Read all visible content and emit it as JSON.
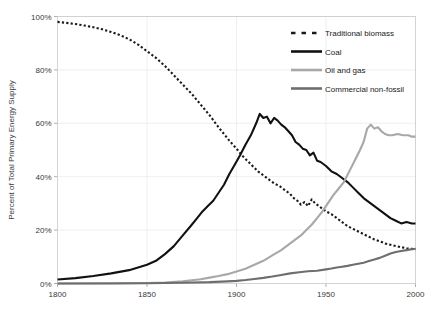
{
  "chart_data": {
    "type": "line",
    "title": "",
    "xlabel": "",
    "ylabel": "Percent of Total Primary Energy Supply",
    "xlim": [
      1800,
      2000
    ],
    "ylim": [
      0,
      100
    ],
    "xticks": [
      1800,
      1850,
      1900,
      1950,
      2000
    ],
    "xtick_labels": [
      "1800",
      "1850",
      "1900",
      "1950",
      "2000"
    ],
    "yticks": [
      0,
      20,
      40,
      60,
      80,
      100
    ],
    "ytick_labels": [
      "0%",
      "20%",
      "40%",
      "60%",
      "80%",
      "100%"
    ],
    "grid": true,
    "legend_position": "top-right",
    "series": [
      {
        "name": "Traditional biomass",
        "color": "#1a1a1a",
        "style": "dashed",
        "width": 2.1,
        "x": [
          1800,
          1805,
          1810,
          1815,
          1820,
          1825,
          1830,
          1835,
          1840,
          1845,
          1850,
          1855,
          1860,
          1865,
          1870,
          1875,
          1880,
          1885,
          1890,
          1893,
          1896,
          1900,
          1903,
          1906,
          1909,
          1912,
          1915,
          1918,
          1921,
          1924,
          1927,
          1930,
          1932,
          1934,
          1936,
          1938,
          1940,
          1942,
          1944,
          1946,
          1948,
          1950,
          1953,
          1956,
          1959,
          1962,
          1965,
          1968,
          1971,
          1974,
          1977,
          1980,
          1983,
          1986,
          1989,
          1992,
          1995,
          1998,
          2000
        ],
        "y": [
          98,
          97.6,
          97.2,
          96.6,
          96,
          95.2,
          94.2,
          93,
          91.5,
          89.5,
          87,
          84.5,
          81.5,
          78,
          74.5,
          71,
          67,
          63,
          58.5,
          56,
          53.5,
          50.5,
          48,
          46,
          44,
          42,
          40.5,
          39,
          37.5,
          36.5,
          35,
          33.5,
          32,
          31,
          29.5,
          30.5,
          29,
          31.5,
          30,
          29,
          28,
          27,
          26,
          24.5,
          23,
          21.5,
          20.5,
          19.5,
          18.5,
          17.5,
          16.5,
          15.8,
          15,
          14.5,
          14,
          13.6,
          13.2,
          13,
          12.8
        ]
      },
      {
        "name": "Coal",
        "color": "#111111",
        "style": "solid",
        "width": 2.1,
        "x": [
          1800,
          1810,
          1820,
          1830,
          1840,
          1850,
          1855,
          1860,
          1865,
          1870,
          1875,
          1878,
          1881,
          1884,
          1887,
          1890,
          1893,
          1896,
          1899,
          1902,
          1905,
          1908,
          1911,
          1913,
          1915,
          1917,
          1919,
          1921,
          1923,
          1925,
          1927,
          1929,
          1931,
          1933,
          1935,
          1937,
          1939,
          1941,
          1943,
          1945,
          1947,
          1950,
          1953,
          1956,
          1959,
          1962,
          1965,
          1968,
          1971,
          1974,
          1977,
          1980,
          1983,
          1986,
          1989,
          1992,
          1995,
          1998,
          2000
        ],
        "y": [
          1.5,
          2,
          2.8,
          3.8,
          5,
          7,
          8.5,
          11,
          14,
          18,
          22,
          24.5,
          27,
          29,
          31,
          34,
          37,
          41,
          44.5,
          48,
          52,
          55.5,
          60,
          63.5,
          62,
          62.5,
          60,
          62,
          61,
          59.5,
          58.5,
          57,
          55.5,
          53,
          52,
          50.5,
          50,
          48,
          49,
          46,
          45.5,
          44,
          42,
          41,
          39.5,
          38,
          36,
          34,
          32,
          30.5,
          29,
          27.5,
          26,
          24.5,
          23.5,
          22.5,
          23,
          22.5,
          22.5
        ]
      },
      {
        "name": "Oil and gas",
        "color": "#a8a8a8",
        "style": "solid",
        "width": 2.1,
        "x": [
          1800,
          1830,
          1850,
          1860,
          1870,
          1875,
          1880,
          1885,
          1890,
          1895,
          1900,
          1905,
          1910,
          1915,
          1920,
          1925,
          1930,
          1933,
          1936,
          1939,
          1942,
          1945,
          1948,
          1951,
          1954,
          1957,
          1960,
          1963,
          1966,
          1969,
          1971,
          1973,
          1975,
          1977,
          1979,
          1981,
          1983,
          1985,
          1987,
          1990,
          1993,
          1996,
          1998,
          2000
        ],
        "y": [
          0,
          0,
          0.2,
          0.4,
          0.8,
          1.2,
          1.6,
          2.2,
          2.8,
          3.5,
          4.5,
          5.5,
          7,
          8.5,
          10.5,
          12.5,
          15,
          16.5,
          18,
          20,
          22,
          24.5,
          27,
          30,
          33,
          35.5,
          38,
          42,
          46,
          50,
          53,
          58,
          59.5,
          58,
          58.5,
          57,
          56,
          55.5,
          55.5,
          56,
          55.5,
          55.5,
          55,
          55
        ]
      },
      {
        "name": "Commercial non-fossil",
        "color": "#6e6e6e",
        "style": "solid",
        "width": 2.1,
        "x": [
          1800,
          1850,
          1870,
          1885,
          1895,
          1900,
          1905,
          1910,
          1915,
          1920,
          1925,
          1930,
          1935,
          1940,
          1945,
          1950,
          1953,
          1956,
          1959,
          1962,
          1965,
          1968,
          1971,
          1974,
          1977,
          1980,
          1983,
          1986,
          1989,
          1992,
          1995,
          1998,
          2000
        ],
        "y": [
          0,
          0.1,
          0.3,
          0.5,
          0.8,
          1,
          1.3,
          1.7,
          2.1,
          2.6,
          3.2,
          3.8,
          4.2,
          4.6,
          4.8,
          5.3,
          5.6,
          6,
          6.3,
          6.6,
          7,
          7.4,
          7.8,
          8.4,
          9,
          9.6,
          10.4,
          11.2,
          11.8,
          12.2,
          12.5,
          12.8,
          13
        ]
      }
    ]
  }
}
